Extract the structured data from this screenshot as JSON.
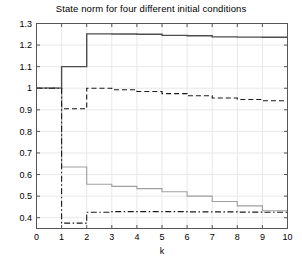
{
  "chart": {
    "title": "State norm for four different initial conditions",
    "xlabel": "k",
    "ylabel": ""
  },
  "axes": {
    "x_ticks": [
      "0",
      "1",
      "2",
      "3",
      "4",
      "5",
      "6",
      "7",
      "8",
      "9",
      "10"
    ],
    "y_ticks": [
      "0.4",
      "0.5",
      "0.6",
      "0.7",
      "0.8",
      "0.9",
      "1",
      "1.1",
      "1.2",
      "1.3"
    ]
  },
  "colors": {
    "axis": "#555555",
    "grid": "#e8e8e8",
    "series_dark": "#4d4d4d",
    "series_light": "#a0a0a0",
    "background": "#ffffff"
  },
  "chart_data": {
    "type": "line",
    "title": "State norm for four different initial conditions",
    "xlabel": "k",
    "ylabel": "",
    "xlim": [
      0,
      10
    ],
    "ylim": [
      0.35,
      1.3
    ],
    "grid": true,
    "legend": null,
    "step_style": "post",
    "x": [
      0,
      1,
      2,
      3,
      4,
      5,
      6,
      7,
      8,
      9,
      10
    ],
    "series": [
      {
        "name": "initial condition 1",
        "style": "solid",
        "color": "#4d4d4d",
        "values": [
          1.0,
          1.1,
          1.252,
          1.251,
          1.25,
          1.245,
          1.243,
          1.238,
          1.237,
          1.236,
          1.236
        ]
      },
      {
        "name": "initial condition 2",
        "style": "dashed",
        "color": "#1a1a1a",
        "values": [
          1.0,
          0.905,
          1.0,
          0.993,
          0.985,
          0.975,
          0.965,
          0.955,
          0.948,
          0.942,
          0.94
        ]
      },
      {
        "name": "initial condition 3",
        "style": "solid",
        "color": "#a0a0a0",
        "values": [
          1.0,
          0.635,
          0.555,
          0.545,
          0.535,
          0.52,
          0.5,
          0.475,
          0.455,
          0.432,
          0.43
        ]
      },
      {
        "name": "initial condition 4",
        "style": "dash-dot",
        "color": "#1a1a1a",
        "values": [
          1.0,
          0.375,
          0.425,
          0.428,
          0.428,
          0.428,
          0.427,
          0.427,
          0.426,
          0.425,
          0.425
        ]
      }
    ]
  }
}
